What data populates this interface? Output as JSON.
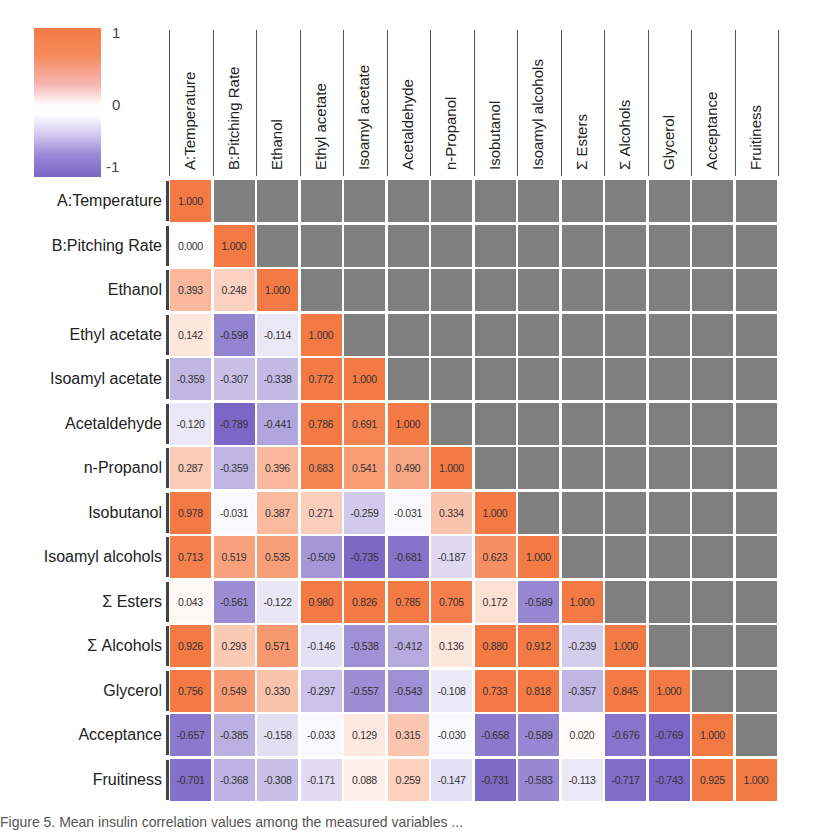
{
  "chart_data": {
    "type": "heatmap",
    "title": "",
    "variables": [
      "A:Temperature",
      "B:Pitching Rate",
      "Ethanol",
      "Ethyl acetate",
      "Isoamyl acetate",
      "Acetaldehyde",
      "n-Propanol",
      "Isobutanol",
      "Isoamyl alcohols",
      "Σ Esters",
      "Σ Alcohols",
      "Glycerol",
      "Acceptance",
      "Fruitiness"
    ],
    "matrix_lower": [
      [
        "1.000"
      ],
      [
        "0.000",
        "1.000"
      ],
      [
        "0.393",
        "0.248",
        "1.000"
      ],
      [
        "0.142",
        "-0.598",
        "-0.114",
        "1.000"
      ],
      [
        "-0.359",
        "-0.307",
        "-0.338",
        "0.772",
        "1.000"
      ],
      [
        "-0.120",
        "-0.789",
        "-0.441",
        "0.786",
        "0.691",
        "1.000"
      ],
      [
        "0.287",
        "-0.359",
        "0.396",
        "0.683",
        "0.541",
        "0.490",
        "1.000"
      ],
      [
        "0.978",
        "-0.031",
        "0.387",
        "0.271",
        "-0.259",
        "-0.031",
        "0.334",
        "1.000"
      ],
      [
        "0.713",
        "0.519",
        "0.535",
        "-0.509",
        "-0.735",
        "-0.681",
        "-0.187",
        "0.623",
        "1.000"
      ],
      [
        "0.043",
        "-0.561",
        "-0.122",
        "0.980",
        "0.826",
        "0.785",
        "0.705",
        "0.172",
        "-0.589",
        "1.000"
      ],
      [
        "0.926",
        "0.293",
        "0.571",
        "-0.146",
        "-0.538",
        "-0.412",
        "0.136",
        "0.880",
        "0.912",
        "-0.239",
        "1.000"
      ],
      [
        "0.756",
        "0.549",
        "0.330",
        "-0.297",
        "-0.557",
        "-0.543",
        "-0.108",
        "0.733",
        "0.818",
        "-0.357",
        "0.845",
        "1.000"
      ],
      [
        "-0.657",
        "-0.385",
        "-0.158",
        "-0.033",
        "0.129",
        "0.315",
        "-0.030",
        "-0.658",
        "-0.589",
        "0.020",
        "-0.676",
        "-0.769",
        "1.000"
      ],
      [
        "-0.701",
        "-0.368",
        "-0.308",
        "-0.171",
        "0.088",
        "0.259",
        "-0.147",
        "-0.731",
        "-0.583",
        "-0.113",
        "-0.717",
        "-0.743",
        "0.925",
        "1.000"
      ]
    ],
    "upper_triangle": "masked grey",
    "color_scale": {
      "min": -1,
      "mid": 0,
      "max": 1,
      "min_color": "#7b68c6",
      "mid_color": "#ffffff",
      "max_color": "#f47a45",
      "tick_labels": [
        "1",
        "0",
        "-1"
      ]
    },
    "legend_position": "top-left"
  },
  "colors": {
    "mask": "#7f7f7f",
    "positive": "#f47a45",
    "negative": "#7b68c6",
    "neutral": "#ffffff"
  },
  "caption": "Figure 5. Mean insulin correlation values among the measured variables ..."
}
